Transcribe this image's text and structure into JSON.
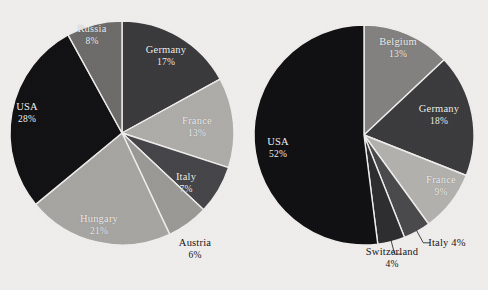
{
  "figure": {
    "background_color": "#f2f1ef",
    "label_light_color": "#f4f3f1",
    "label_dark_color": "#16161a"
  },
  "chart_data": [
    {
      "type": "pie",
      "name": "left-pie",
      "title": "",
      "center": [
        122,
        133
      ],
      "radius": 112,
      "start_angle_deg": 0,
      "direction": "clockwise",
      "categories": [
        "Germany",
        "France",
        "Italy",
        "Austria",
        "Hungary",
        "USA",
        "Russia"
      ],
      "values": [
        17,
        13,
        7,
        6,
        21,
        28,
        8
      ],
      "unit": "%",
      "slices": [
        {
          "label": "Germany",
          "value": 17,
          "value_text": "17%",
          "color": "#3b3b3e",
          "label_placement": "inside",
          "label_color": "light",
          "label_x": 166,
          "label_y": 56
        },
        {
          "label": "France",
          "value": 13,
          "value_text": "13%",
          "color": "#b0aeab",
          "label_placement": "inside",
          "label_color": "light",
          "label_x": 197,
          "label_y": 127
        },
        {
          "label": "Italy",
          "value": 7,
          "value_text": "7%",
          "color": "#46464a",
          "label_placement": "inside",
          "label_color": "light",
          "label_x": 186,
          "label_y": 183
        },
        {
          "label": "Austria",
          "value": 6,
          "value_text": "6%",
          "color": "#9d9b98",
          "label_placement": "outside",
          "label_color": "dark",
          "label_x": 195,
          "label_y": 249
        },
        {
          "label": "Hungary",
          "value": 21,
          "value_text": "21%",
          "color": "#a9a7a4",
          "label_placement": "inside",
          "label_color": "light",
          "label_x": 99,
          "label_y": 225
        },
        {
          "label": "USA",
          "value": 28,
          "value_text": "28%",
          "color": "#121214",
          "label_placement": "inside",
          "label_color": "light",
          "label_x": 27,
          "label_y": 113
        },
        {
          "label": "Russia",
          "value": 8,
          "value_text": "8%",
          "color": "#6e6d6c",
          "label_placement": "inside",
          "label_color": "light",
          "label_x": 92,
          "label_y": 35
        }
      ]
    },
    {
      "type": "pie",
      "name": "right-pie",
      "title": "",
      "center": [
        364,
        135
      ],
      "radius": 110,
      "start_angle_deg": 0,
      "direction": "clockwise",
      "categories": [
        "Belgium",
        "Germany",
        "France",
        "Italy",
        "Switzerland",
        "USA"
      ],
      "values": [
        13,
        18,
        9,
        4,
        4,
        52
      ],
      "unit": "%",
      "slices": [
        {
          "label": "Belgium",
          "value": 13,
          "value_text": "13%",
          "color": "#858381",
          "label_placement": "inside",
          "label_color": "light",
          "label_x": 398,
          "label_y": 48
        },
        {
          "label": "Germany",
          "value": 18,
          "value_text": "18%",
          "color": "#3c3c3f",
          "label_placement": "inside",
          "label_color": "light",
          "label_x": 439,
          "label_y": 115
        },
        {
          "label": "France",
          "value": 9,
          "value_text": "9%",
          "color": "#b5b3b0",
          "label_placement": "inside",
          "label_color": "light",
          "label_x": 441,
          "label_y": 186
        },
        {
          "label": "Italy",
          "value": 4,
          "value_text": "4%",
          "color": "#4b4b4e",
          "label_placement": "outside-leader",
          "label_color": "dark",
          "label_x": 447,
          "label_y": 241
        },
        {
          "label": "Switzerland",
          "value": 4,
          "value_text": "4%",
          "color": "#2e2e31",
          "label_placement": "outside-leader",
          "label_color": "dark",
          "label_x": 392,
          "label_y": 258
        },
        {
          "label": "USA",
          "value": 52,
          "value_text": "52%",
          "color": "#111113",
          "label_placement": "inside",
          "label_color": "light",
          "label_x": 278,
          "label_y": 148
        }
      ]
    }
  ]
}
